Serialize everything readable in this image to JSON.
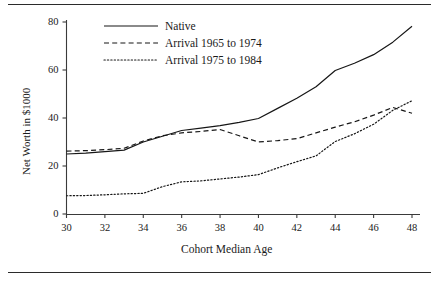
{
  "chart_data": {
    "type": "line",
    "title": "",
    "xlabel": "Cohort Median Age",
    "ylabel": "Net Worth in $1000",
    "xlim": [
      30,
      48
    ],
    "ylim": [
      0,
      80
    ],
    "xticks": [
      30,
      32,
      34,
      36,
      38,
      40,
      42,
      44,
      46,
      48
    ],
    "yticks": [
      0,
      20,
      40,
      60,
      80
    ],
    "grid": false,
    "legend_position": "top-left-inside",
    "x": [
      30,
      31,
      32,
      33,
      34,
      35,
      36,
      37,
      38,
      39,
      40,
      41,
      42,
      43,
      44,
      45,
      46,
      47,
      48
    ],
    "series": [
      {
        "name": "Native",
        "style": "solid",
        "color": "#161616",
        "values": [
          25.0,
          25.4,
          26.0,
          26.6,
          30.0,
          32.4,
          34.8,
          35.8,
          36.8,
          38.2,
          39.8,
          44.0,
          48.2,
          53.0,
          59.8,
          62.8,
          66.4,
          71.6,
          78.2
        ]
      },
      {
        "name": "Arrival 1965 to 1974",
        "style": "dashed",
        "color": "#161616",
        "values": [
          26.2,
          26.4,
          26.8,
          27.4,
          30.4,
          32.6,
          33.8,
          34.4,
          35.2,
          32.6,
          30.0,
          30.6,
          31.4,
          33.8,
          36.2,
          38.4,
          41.2,
          44.4,
          42.0
        ]
      },
      {
        "name": "Arrival 1975 to 1984",
        "style": "dotted",
        "color": "#161616",
        "values": [
          7.6,
          7.7,
          8.0,
          8.4,
          8.6,
          11.4,
          13.4,
          13.8,
          14.6,
          15.4,
          16.4,
          19.2,
          21.8,
          24.2,
          30.2,
          33.4,
          37.4,
          43.2,
          47.2
        ]
      }
    ]
  },
  "axes": {
    "xlabel": "Cohort Median Age",
    "ylabel": "Net Worth in $1000",
    "xticks": [
      "30",
      "32",
      "34",
      "36",
      "38",
      "40",
      "42",
      "44",
      "46",
      "48"
    ],
    "yticks": [
      "0",
      "20",
      "40",
      "60",
      "80"
    ]
  },
  "legend": {
    "entries": [
      {
        "label": "Native",
        "style": "solid"
      },
      {
        "label": "Arrival 1965 to 1974",
        "style": "dashed"
      },
      {
        "label": "Arrival 1975 to 1984",
        "style": "dotted"
      }
    ]
  }
}
